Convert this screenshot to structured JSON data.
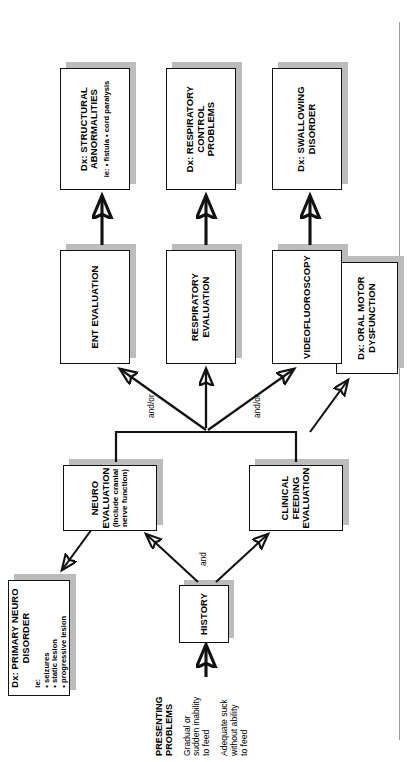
{
  "figure": {
    "orientation": "rotated-90-ccw",
    "page_rule_color": "#9a9a9a",
    "box_border_color": "#111111",
    "box_shadow_color": "#bcbcbc",
    "box_fill_color": "#ffffff"
  },
  "presenting": {
    "heading": "PRESENTING\nPROBLEMS",
    "item1": "Gradual or\nsudden inability\nto feed",
    "item2": "Adequate suck\nwithout ability\nto feed"
  },
  "nodes": {
    "history": {
      "title": "HISTORY"
    },
    "neuro_eval": {
      "title": "NEURO EVALUATION",
      "subtitle": "(include cranial\nnerve function)"
    },
    "clinical_feeding_eval": {
      "title": "CLINICAL FEEDING\nEVALUATION"
    },
    "primary_neuro_disorder": {
      "title": "Dx: PRIMARY NEURO\nDISORDER",
      "bullets_label": "ie:",
      "bullets": [
        "• seizures",
        "• static lesion",
        "• progressive lesion"
      ]
    },
    "oral_motor_dysfunction": {
      "title": "Dx: ORAL MOTOR\nDYSFUNCTION"
    },
    "ent_eval": {
      "title": "ENT EVALUATION"
    },
    "respiratory_eval": {
      "title": "RESPIRATORY\nEVALUATION"
    },
    "videofluoroscopy": {
      "title": "VIDEOFLUOROSCOPY"
    },
    "structural_abnormalities": {
      "title": "Dx: STRUCTURAL\nABNORMALITIES",
      "bullets_label": "ie:",
      "bullets": [
        "• fistula",
        "• cord paralysis"
      ]
    },
    "respiratory_control_problems": {
      "title": "Dx: RESPIRATORY\nCONTROL\nPROBLEMS"
    },
    "swallowing_disorder": {
      "title": "Dx: SWALLOWING\nDISORDER"
    }
  },
  "edge_labels": {
    "and": "and",
    "and_or_left": "and/or",
    "and_or_right": "and/or"
  }
}
